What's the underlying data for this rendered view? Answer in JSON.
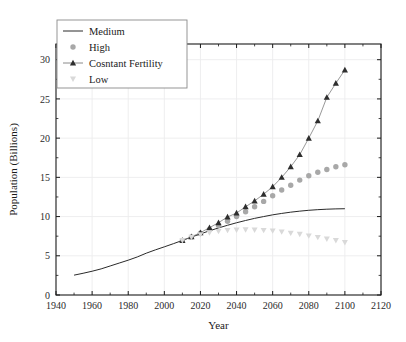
{
  "chart_data": {
    "type": "line",
    "title": "",
    "xlabel": "Year",
    "ylabel": "Population (Billions)",
    "xlim": [
      1940,
      2120
    ],
    "ylim": [
      0,
      32
    ],
    "xticks": [
      1940,
      1960,
      1980,
      2000,
      2020,
      2040,
      2060,
      2080,
      2100,
      2120
    ],
    "yticks": [
      0,
      5,
      10,
      15,
      20,
      25,
      30
    ],
    "xtick_minor_step": 10,
    "ytick_minor_step": 2.5,
    "grid": true,
    "legend_position": "top-left",
    "series": [
      {
        "name": "Medium",
        "marker": "none",
        "style": "line",
        "color": "#2a2a2a",
        "x": [
          1950,
          1955,
          1960,
          1965,
          1970,
          1975,
          1980,
          1985,
          1990,
          1995,
          2000,
          2005,
          2010,
          2015,
          2020,
          2025,
          2030,
          2035,
          2040,
          2045,
          2050,
          2055,
          2060,
          2065,
          2070,
          2075,
          2080,
          2085,
          2090,
          2095,
          2100
        ],
        "y": [
          2.53,
          2.77,
          3.03,
          3.33,
          3.7,
          4.07,
          4.44,
          4.85,
          5.33,
          5.75,
          6.14,
          6.54,
          6.96,
          7.38,
          7.79,
          8.18,
          8.55,
          8.89,
          9.21,
          9.5,
          9.77,
          10.0,
          10.22,
          10.4,
          10.56,
          10.69,
          10.8,
          10.88,
          10.94,
          10.98,
          11.0
        ]
      },
      {
        "name": "High",
        "marker": "circle",
        "style": "markers",
        "color": "#a8a8a8",
        "x": [
          2010,
          2015,
          2020,
          2025,
          2030,
          2035,
          2040,
          2045,
          2050,
          2055,
          2060,
          2065,
          2070,
          2075,
          2080,
          2085,
          2090,
          2095,
          2100
        ],
        "y": [
          6.96,
          7.4,
          7.88,
          8.35,
          8.86,
          9.41,
          10.0,
          10.62,
          11.26,
          11.93,
          12.65,
          13.38,
          14.0,
          14.65,
          15.21,
          15.65,
          16.0,
          16.35,
          16.6
        ]
      },
      {
        "name": "Cosntant Fertility",
        "marker": "triangle-up",
        "style": "line-markers",
        "color": "#2e2e2e",
        "x": [
          2010,
          2015,
          2020,
          2025,
          2030,
          2035,
          2040,
          2045,
          2050,
          2055,
          2060,
          2065,
          2070,
          2075,
          2080,
          2085,
          2090,
          2095,
          2100
        ],
        "y": [
          6.96,
          7.42,
          7.95,
          8.58,
          9.22,
          9.95,
          10.45,
          11.25,
          12.0,
          12.85,
          13.8,
          15.0,
          16.35,
          17.9,
          20.0,
          22.2,
          25.2,
          27.0,
          28.7
        ]
      },
      {
        "name": "Low",
        "marker": "triangle-down",
        "style": "markers",
        "color": "#d9d9d9",
        "x": [
          2010,
          2015,
          2020,
          2025,
          2030,
          2035,
          2040,
          2045,
          2050,
          2055,
          2060,
          2065,
          2070,
          2075,
          2080,
          2085,
          2090,
          2095,
          2100
        ],
        "y": [
          6.96,
          7.36,
          7.7,
          7.95,
          8.12,
          8.25,
          8.3,
          8.32,
          8.3,
          8.25,
          8.18,
          8.05,
          7.9,
          7.75,
          7.55,
          7.35,
          7.15,
          6.95,
          6.7
        ]
      }
    ],
    "legend": [
      {
        "label": "Medium",
        "marker": "line"
      },
      {
        "label": "High",
        "marker": "circle"
      },
      {
        "label": "Cosntant Fertility",
        "marker": "triangle-up-line"
      },
      {
        "label": "Low",
        "marker": "triangle-down"
      }
    ]
  }
}
